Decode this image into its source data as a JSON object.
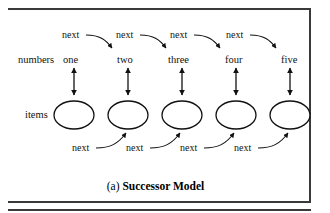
{
  "figure": {
    "caption_prefix": "(a)",
    "caption_title": "Successor Model",
    "row_labels": {
      "numbers": "numbers",
      "items": "items"
    },
    "numbers": [
      "one",
      "two",
      "three",
      "four",
      "five"
    ],
    "top_edge_labels": [
      "next",
      "next",
      "next",
      "next"
    ],
    "bottom_edge_labels": [
      "next",
      "next",
      "next",
      "next"
    ],
    "node_count": 5,
    "colors": {
      "ink": "#111111",
      "rule": "#3a3a3a",
      "background": "#ffffff"
    }
  }
}
